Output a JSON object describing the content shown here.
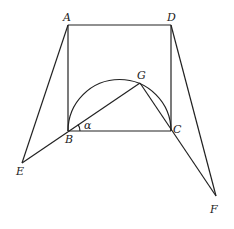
{
  "diagram": {
    "type": "geometry",
    "points": {
      "A": {
        "label": "A",
        "x": 68,
        "y": 25
      },
      "D": {
        "label": "D",
        "x": 171,
        "y": 25
      },
      "B": {
        "label": "B",
        "x": 68,
        "y": 131
      },
      "C": {
        "label": "C",
        "x": 171,
        "y": 131
      },
      "G": {
        "label": "G",
        "x": 140,
        "y": 83
      },
      "E": {
        "label": "E",
        "x": 22,
        "y": 163
      },
      "F": {
        "label": "F",
        "x": 216,
        "y": 196
      }
    },
    "angle_label": "α",
    "segments": [
      "AD",
      "AB",
      "DC",
      "BC",
      "AE",
      "EG",
      "DF",
      "GF"
    ],
    "arc": {
      "description": "semicircle on diameter BC",
      "center_x": 119.5,
      "center_y": 131,
      "radius": 51.5
    }
  }
}
